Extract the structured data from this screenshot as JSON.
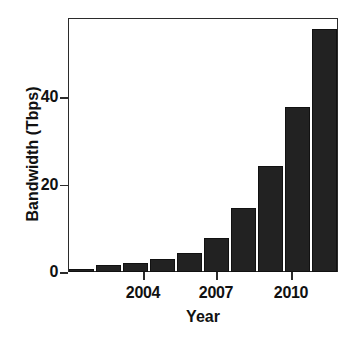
{
  "chart_data": {
    "type": "bar",
    "title": "",
    "xlabel": "Year",
    "ylabel": "Bandwidth (Tbps)",
    "categories": [
      "2002",
      "2003",
      "2004",
      "2005",
      "2006",
      "2007",
      "2008",
      "2009",
      "2010",
      "2011"
    ],
    "values": [
      0.7,
      1.5,
      2.1,
      3.0,
      4.3,
      7.8,
      14.6,
      24.2,
      37.7,
      55.5
    ],
    "x": [
      2002,
      2003,
      2004,
      2005,
      2006,
      2007,
      2008,
      2009,
      2010,
      2011
    ],
    "xlim": [
      2001.4,
      2011.6
    ],
    "ylim": [
      0,
      58
    ],
    "yticks": [
      0,
      20,
      40
    ],
    "ytick_labels": [
      "0",
      "20",
      "40"
    ],
    "xticks": [
      2004,
      2007,
      2010
    ],
    "xtick_labels": [
      "2004",
      "2007",
      "2010"
    ],
    "grid": false,
    "legend": null,
    "bar_color": "#222222",
    "axis_color": "#2b2b2b",
    "background": "#ffffff"
  },
  "axes": {
    "y_label_text": "Bandwidth (Tbps)",
    "x_label_text": "Year",
    "ytick_0": "0",
    "ytick_20": "20",
    "ytick_40": "40",
    "xtick_2004": "2004",
    "xtick_2007": "2007",
    "xtick_2010": "2010"
  }
}
